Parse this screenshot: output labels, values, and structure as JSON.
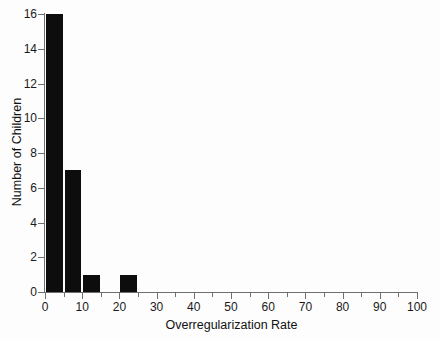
{
  "chart_data": {
    "type": "bar",
    "subtype": "histogram",
    "title": "",
    "subtitle": "",
    "xlabel": "Overregularization Rate",
    "ylabel": "Number of Children",
    "xlim": [
      0,
      100
    ],
    "ylim": [
      0,
      16
    ],
    "bin_width": 5,
    "grid": false,
    "legend": null,
    "bar_color": "#0d0d0d",
    "background_color": "#fdfdfd",
    "axis_color": "#6f6f6f",
    "categories": [
      "0-5",
      "5-10",
      "10-15",
      "15-20",
      "20-25",
      "25-30"
    ],
    "bins": [
      {
        "start": 0,
        "end": 5,
        "value": 16
      },
      {
        "start": 5,
        "end": 10,
        "value": 7
      },
      {
        "start": 10,
        "end": 15,
        "value": 1
      },
      {
        "start": 15,
        "end": 20,
        "value": 0
      },
      {
        "start": 20,
        "end": 25,
        "value": 1
      },
      {
        "start": 25,
        "end": 30,
        "value": 0
      }
    ],
    "values": [
      16,
      7,
      1,
      0,
      1,
      0
    ],
    "x_ticks_major": [
      0,
      10,
      20,
      30,
      40,
      50,
      60,
      70,
      80,
      90,
      100
    ],
    "x_tick_labels": [
      "0",
      "10",
      "20",
      "30",
      "40",
      "50",
      "60",
      "70",
      "80",
      "90",
      "100"
    ],
    "x_ticks_minor": [
      5,
      15,
      25,
      35,
      45,
      55,
      65,
      75,
      85,
      95
    ],
    "y_ticks": [
      0,
      2,
      4,
      6,
      8,
      10,
      12,
      14,
      16
    ],
    "y_tick_labels": [
      "0",
      "2",
      "4",
      "6",
      "8",
      "10",
      "12",
      "14",
      "16"
    ]
  }
}
